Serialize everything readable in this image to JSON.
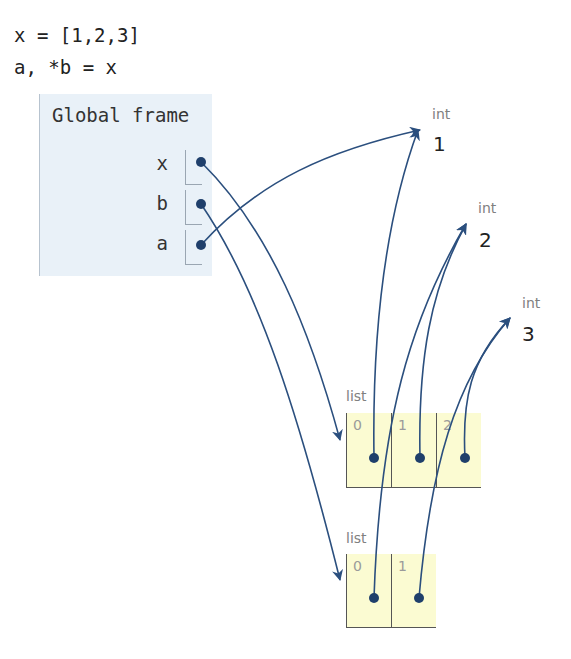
{
  "code": {
    "lines": [
      "x = [1,2,3]",
      "a, *b = x"
    ]
  },
  "global_frame": {
    "title": "Global frame",
    "variables": [
      {
        "name": "x",
        "points_to": "list_1"
      },
      {
        "name": "b",
        "points_to": "list_2"
      },
      {
        "name": "a",
        "points_to": "int_1"
      }
    ]
  },
  "objects": {
    "int_1": {
      "type": "int",
      "value": "1"
    },
    "int_2": {
      "type": "int",
      "value": "2"
    },
    "int_3": {
      "type": "int",
      "value": "3"
    },
    "list_1": {
      "type": "list",
      "indices": [
        "0",
        "1",
        "2"
      ],
      "points_to": [
        "int_1",
        "int_2",
        "int_3"
      ]
    },
    "list_2": {
      "type": "list",
      "indices": [
        "0",
        "1"
      ],
      "points_to": [
        "int_2",
        "int_3"
      ]
    }
  },
  "colors": {
    "arrow": "#2b4f7e",
    "frame_bg": "#e9f1f8",
    "list_bg": "#fbfbd2"
  }
}
